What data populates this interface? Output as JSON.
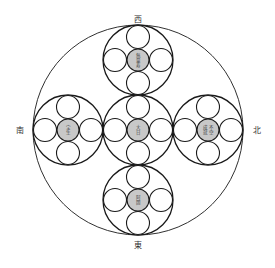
{
  "directions": {
    "top": "西",
    "left": "南",
    "right": "北",
    "bottom": "東"
  },
  "buddhas": {
    "center": [
      "大",
      "日"
    ],
    "top": [
      "無",
      "量",
      "寿"
    ],
    "left": [
      "宝",
      "生"
    ],
    "right": [
      "不",
      "空",
      "成",
      "就"
    ],
    "bottom": [
      "阿",
      "閦"
    ]
  },
  "colors": {
    "stroke": "#1a1a1a",
    "core_fill": "#c8c8c8",
    "background": "#ffffff"
  }
}
